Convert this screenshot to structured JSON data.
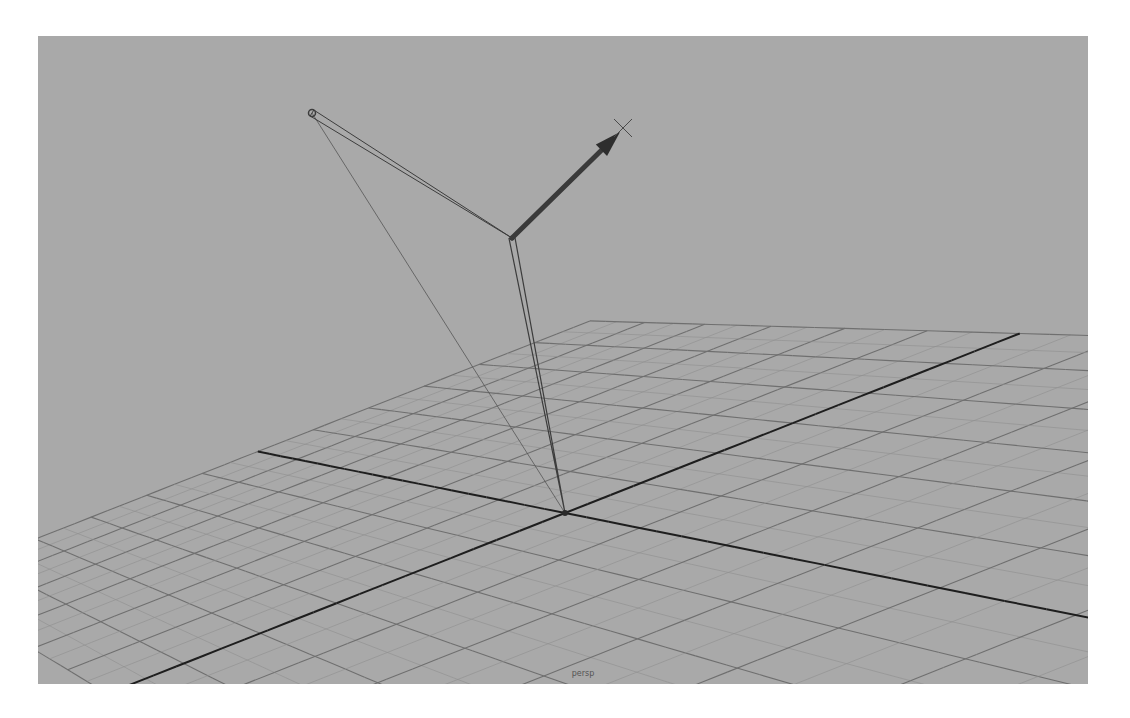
{
  "viewport": {
    "camera_label": "persp",
    "background_color": "#a9a9a9",
    "grid_line_color": "#6f6f6f",
    "grid_subline_color": "#8e8e8e",
    "axis_line_color": "#1e1e1e",
    "bone_color": "#3c3c3c"
  },
  "scene": {
    "grid": {
      "origin": [
        527,
        477
      ],
      "axis_a_end": [
        145,
        404
      ],
      "axis_b_end": [
        807,
        389
      ]
    },
    "joints": [
      {
        "name": "root-joint",
        "pos": [
          527,
          477
        ]
      },
      {
        "name": "middle-joint",
        "pos": [
          474,
          202
        ]
      },
      {
        "name": "end-joint",
        "pos": [
          274,
          77
        ]
      }
    ],
    "ik_handle": {
      "start": [
        474,
        202
      ],
      "cone_tip": [
        582,
        96
      ],
      "locator": [
        585,
        92
      ]
    },
    "pole_vector_line": {
      "from": [
        274,
        77
      ],
      "to": [
        527,
        477
      ]
    }
  }
}
